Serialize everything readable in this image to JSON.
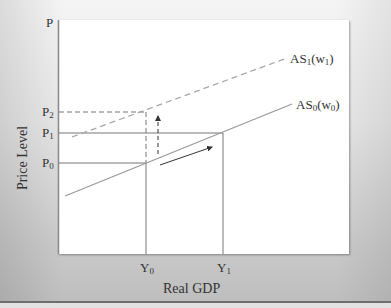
{
  "diagram": {
    "axes": {
      "y_axis_label": "Price Level",
      "y_axis_symbol": "P",
      "x_axis_label": "Real GDP"
    },
    "curves": [
      {
        "id": "AS0",
        "label_main": "AS",
        "label_sub": "0",
        "label_paren": "(w",
        "label_paren_sub": "0",
        "label_close": ")",
        "style": "solid",
        "color": "#9a9a9a"
      },
      {
        "id": "AS1",
        "label_main": "AS",
        "label_sub": "1",
        "label_paren": "(w",
        "label_paren_sub": "1",
        "label_close": ")",
        "style": "dashed",
        "color": "#a8a8a8"
      }
    ],
    "price_levels": [
      {
        "main": "P",
        "sub": "2",
        "style": "dashed"
      },
      {
        "main": "P",
        "sub": "1",
        "style": "solid"
      },
      {
        "main": "P",
        "sub": "0",
        "style": "solid"
      }
    ],
    "output_levels": [
      {
        "main": "Y",
        "sub": "0"
      },
      {
        "main": "Y",
        "sub": "1"
      }
    ],
    "arrows": [
      {
        "id": "shift-up",
        "style": "dashed",
        "direction": "up"
      },
      {
        "id": "move-along",
        "style": "solid",
        "direction": "up-right"
      }
    ],
    "colors": {
      "axis": "#8a8a8a",
      "guide": "#7a7a7a",
      "arrow": "#333333"
    }
  }
}
